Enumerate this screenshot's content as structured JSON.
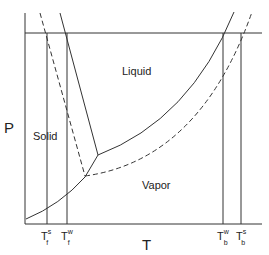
{
  "diagram": {
    "type": "phase-diagram",
    "axes": {
      "x_label": "T",
      "y_label": "P"
    },
    "regions": {
      "solid": "Solid",
      "liquid": "Liquid",
      "vapor": "Vapor"
    },
    "ticks": [
      {
        "id": "tfs",
        "main": "T",
        "sup": "s",
        "sub": "f"
      },
      {
        "id": "tfw",
        "main": "T",
        "sup": "w",
        "sub": "f"
      },
      {
        "id": "tbw",
        "main": "T",
        "sup": "w",
        "sub": "b"
      },
      {
        "id": "tbs",
        "main": "T",
        "sup": "s",
        "sub": "b"
      }
    ],
    "legend_hint": {
      "solid_line": "w",
      "dashed_line": "s"
    },
    "colors": {
      "line": "#333333",
      "background": "#ffffff"
    }
  }
}
